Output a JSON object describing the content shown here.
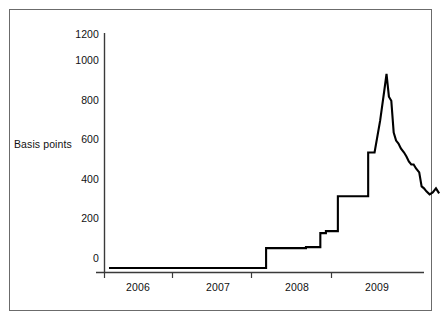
{
  "figure": {
    "background_color": "#ffffff",
    "border_color": "#6b6b6b",
    "axis_color": "#3a3a3a",
    "series_color": "#000000"
  },
  "axis": {
    "ylabel": "Basis points",
    "y_ticks": [
      "0",
      "200",
      "400",
      "600",
      "800",
      "1000",
      "1200"
    ],
    "x_ticks": [
      "2006",
      "2007",
      "2008",
      "2009"
    ]
  },
  "chart_data": {
    "type": "line",
    "title": "",
    "xlabel": "",
    "ylabel": "Basis points",
    "ylim": [
      0,
      1200
    ],
    "xlim": [
      2005.5,
      2009.5
    ],
    "grid": false,
    "legend": null,
    "y_ticks": [
      0,
      200,
      400,
      600,
      800,
      1000,
      1200
    ],
    "x_ticks": [
      2006,
      2007,
      2008,
      2009
    ],
    "x_tick_labels": [
      "2006",
      "2007",
      "2008",
      "2009"
    ],
    "series": [
      {
        "name": "Basis points",
        "x": [
          2005.55,
          2007.52,
          2007.52,
          2008.02,
          2008.02,
          2008.2,
          2008.2,
          2008.27,
          2008.27,
          2008.42,
          2008.42,
          2008.8,
          2008.8,
          2008.88,
          2008.95,
          2009.0,
          2009.03,
          2009.06,
          2009.09,
          2009.12,
          2009.15,
          2009.18,
          2009.21,
          2009.25,
          2009.28,
          2009.31,
          2009.34,
          2009.37,
          2009.4,
          2009.44,
          2009.47,
          2009.5,
          2009.53,
          2009.57,
          2009.61,
          2009.65,
          2009.69
        ],
        "values": [
          20,
          20,
          120,
          120,
          125,
          125,
          195,
          195,
          205,
          205,
          380,
          380,
          600,
          600,
          760,
          905,
          995,
          880,
          860,
          700,
          660,
          645,
          620,
          600,
          580,
          555,
          540,
          540,
          520,
          500,
          430,
          420,
          405,
          390,
          400,
          420,
          395
        ]
      }
    ],
    "annotations": [
      {
        "text": "flat baseline near 20 bps through mid-2007"
      },
      {
        "text": "step up to ~120 bps in late 2007"
      },
      {
        "text": "steps to ~200 then ~380 bps during 2008"
      },
      {
        "text": "spike peak ~1000 bps"
      },
      {
        "text": "jagged decline settling near ~390 bps"
      }
    ]
  }
}
